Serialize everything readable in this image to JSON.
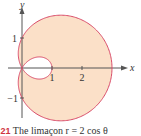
{
  "chart_data": {
    "type": "line",
    "subtype": "polar",
    "title": "",
    "equation": "r = 1 + 2 cos θ",
    "curve_name": "limaçon",
    "xlabel": "x",
    "ylabel": "y",
    "x_ticks": [
      1,
      2
    ],
    "x_tick_labels": [
      "1",
      "2"
    ],
    "y_ticks": [
      1,
      -1
    ],
    "y_tick_labels": [
      "1",
      "−1"
    ],
    "xlim": [
      -0.6,
      3.5
    ],
    "ylim": [
      -2.0,
      2.3
    ],
    "grid": false,
    "legend": false,
    "features": {
      "outer_loop_x_max": 3,
      "inner_loop_x_max": 1,
      "y_max": 1.76,
      "y_min": -1.76
    },
    "colors": {
      "curve": "#d94a68",
      "fill": "#fbe0c8",
      "inner_loop_fill": "#ffffff",
      "axes": "#555555"
    }
  },
  "caption": {
    "figure_number": ".21",
    "text": "The limaçon r = 2 cos θ"
  }
}
